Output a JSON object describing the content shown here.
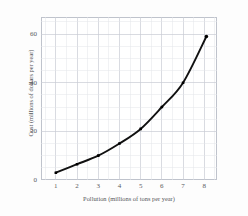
{
  "figure": {
    "caption_faint": "",
    "background_color": "#fdfdfd",
    "plot_background_color": "#ffffff"
  },
  "chart_data": {
    "type": "line",
    "title": "",
    "subtitle": "",
    "xlabel": "Pollution (millions of tons per year)",
    "ylabel": "Cost (millions of dollars per year)",
    "xlim": [
      0.3,
      8.6
    ],
    "ylim": [
      0,
      67
    ],
    "xticks": [
      1,
      2,
      3,
      4,
      5,
      6,
      7,
      8
    ],
    "xtick_labels": [
      "1",
      "2",
      "3",
      "4",
      "5",
      "6",
      "7",
      "8"
    ],
    "yticks": [
      0,
      20,
      40,
      60
    ],
    "ytick_labels": [
      "0",
      "20",
      "40",
      "60"
    ],
    "minor_x_step": 0.5,
    "minor_y_step": 5,
    "grid": true,
    "grid_color": "#c9ccd4",
    "minor_grid_color": "#e3e5ea",
    "legend": false,
    "legend_position": "none",
    "line_color": "#111111",
    "marker_color": "#000000",
    "marker_style": "square",
    "x": [
      1.0,
      2.0,
      3.0,
      4.0,
      5.0,
      6.0,
      7.0,
      8.1
    ],
    "y": [
      3,
      6.5,
      10,
      15,
      21,
      30,
      40,
      59
    ],
    "series": [
      {
        "name": "Cost of pollution reduction",
        "x": [
          1.0,
          2.0,
          3.0,
          4.0,
          5.0,
          6.0,
          7.0,
          8.1
        ],
        "values": [
          3,
          6.5,
          10,
          15,
          21,
          30,
          40,
          59
        ]
      }
    ],
    "points": [
      {
        "x": 1.0,
        "y": 3,
        "label": "(1, 3)"
      },
      {
        "x": 2.0,
        "y": 6.5,
        "label": "(2, 6.5)"
      },
      {
        "x": 3.0,
        "y": 10,
        "label": "(3, 10)"
      },
      {
        "x": 4.0,
        "y": 15,
        "label": "(4, 15)"
      },
      {
        "x": 5.0,
        "y": 21,
        "label": "(5, 21)"
      },
      {
        "x": 6.0,
        "y": 30,
        "label": "(6, 30)"
      },
      {
        "x": 7.0,
        "y": 40,
        "label": "(7, 40)"
      },
      {
        "x": 8.1,
        "y": 59,
        "label": "(8.1, 59)"
      }
    ],
    "annotations": []
  }
}
